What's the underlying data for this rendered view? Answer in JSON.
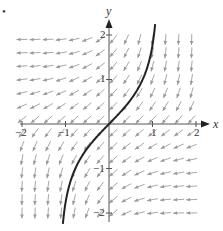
{
  "figure": {
    "bullet": "•",
    "x_axis_label": "x",
    "y_axis_label": "y",
    "x_tick_labels": [
      "−2",
      "−1",
      "1",
      "2"
    ],
    "y_tick_labels": [
      "2",
      "1",
      "−1",
      "−2"
    ]
  },
  "chart_data": {
    "type": "slope_field",
    "title": "",
    "xlabel": "x",
    "ylabel": "y",
    "xlim": [
      -2,
      2
    ],
    "ylim": [
      -2,
      2
    ],
    "x_ticks": [
      -2,
      -1,
      1,
      2
    ],
    "y_ticks": [
      -2,
      -1,
      1,
      2
    ],
    "field_description": "Direction field with slope dy/dx = e^(xy); arrows point down-left: horizontal in quadrants II and IV, vertical in quadrants I and III",
    "grid_step": 0.3,
    "solution_curve": {
      "through_point": [
        0,
        0
      ],
      "slope_at_origin": 1,
      "x_range": [
        -0.9,
        0.9
      ],
      "y_range": [
        -2.2,
        2.2
      ]
    },
    "colors": {
      "arrows": "#a8a8a8",
      "curve": "#222222",
      "axes": "#555555"
    }
  }
}
